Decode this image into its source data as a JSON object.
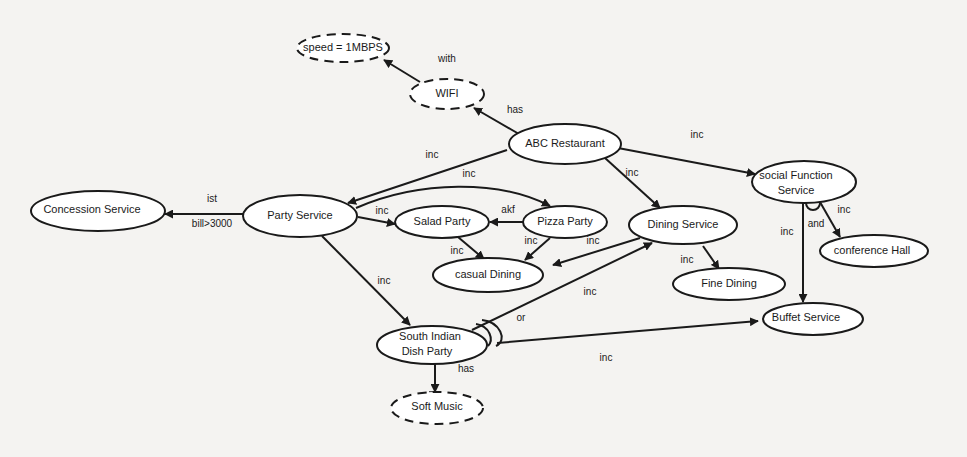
{
  "diagram": {
    "title": "",
    "nodes": [
      {
        "id": "speed",
        "label": [
          "speed = 1MBPS"
        ],
        "dashed": true
      },
      {
        "id": "wifi",
        "label": [
          "WIFI"
        ],
        "dashed": true
      },
      {
        "id": "abc",
        "label": [
          "ABC Restaurant"
        ],
        "dashed": false
      },
      {
        "id": "concession",
        "label": [
          "Concession Service"
        ],
        "dashed": false
      },
      {
        "id": "party",
        "label": [
          "Party Service"
        ],
        "dashed": false
      },
      {
        "id": "salad",
        "label": [
          "Salad Party"
        ],
        "dashed": false
      },
      {
        "id": "pizza",
        "label": [
          "Pizza Party"
        ],
        "dashed": false
      },
      {
        "id": "casual",
        "label": [
          "casual Dining"
        ],
        "dashed": false
      },
      {
        "id": "dining",
        "label": [
          "Dining Service"
        ],
        "dashed": false
      },
      {
        "id": "fine",
        "label": [
          "Fine Dining"
        ],
        "dashed": false
      },
      {
        "id": "social",
        "label": [
          "social Function",
          "Service"
        ],
        "dashed": false
      },
      {
        "id": "conference",
        "label": [
          "conference Hall"
        ],
        "dashed": false
      },
      {
        "id": "buffet",
        "label": [
          "Buffet Service"
        ],
        "dashed": false
      },
      {
        "id": "southindian",
        "label": [
          "South Indian",
          "Dish Party"
        ],
        "dashed": false
      },
      {
        "id": "softmusic",
        "label": [
          "Soft Music"
        ],
        "dashed": true
      }
    ],
    "edges": [
      {
        "from": "wifi",
        "to": "speed",
        "label": "with"
      },
      {
        "from": "abc",
        "to": "wifi",
        "label": "has"
      },
      {
        "from": "abc",
        "to": "party",
        "label": "inc"
      },
      {
        "from": "abc",
        "to": "dining",
        "label": "inc"
      },
      {
        "from": "abc",
        "to": "social",
        "label": "inc"
      },
      {
        "from": "party",
        "to": "concession",
        "label": "ist",
        "sublabel": "bill>3000"
      },
      {
        "from": "party",
        "to": "salad",
        "label": "inc"
      },
      {
        "from": "party",
        "to": "pizza",
        "label": "inc"
      },
      {
        "from": "party",
        "to": "southindian",
        "label": "inc"
      },
      {
        "from": "pizza",
        "to": "salad",
        "label": "akf"
      },
      {
        "from": "salad",
        "to": "casual",
        "label": "inc"
      },
      {
        "from": "pizza",
        "to": "casual",
        "label": "inc"
      },
      {
        "from": "dining",
        "to": "casual",
        "label": "inc"
      },
      {
        "from": "dining",
        "to": "fine",
        "label": "inc"
      },
      {
        "from": "southindian",
        "to": "dining",
        "label": "inc"
      },
      {
        "from": "southindian",
        "to": "buffet",
        "label": "inc"
      },
      {
        "from": "southindian",
        "to": "softmusic",
        "label": "has"
      },
      {
        "from": "social",
        "to": "buffet",
        "label": "inc"
      },
      {
        "from": "social",
        "to": "conference",
        "label": "inc"
      }
    ],
    "connectors": [
      {
        "at": "social",
        "label": "and"
      },
      {
        "at": "southindian",
        "label": "or"
      }
    ]
  }
}
